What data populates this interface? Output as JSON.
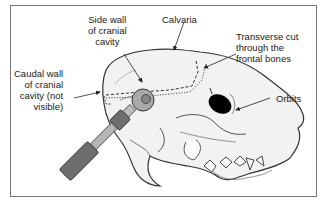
{
  "figure": {
    "labels": {
      "side_wall": "Side wall\nof cranial\ncavity",
      "calvaria": "Calvaria",
      "transverse_cut": "Transverse cut\nthrough the\nfrontal bones",
      "caudal_wall": "Caudal wall\nof cranial\ncavity (not\nvisible)",
      "orbits": "Orbits"
    },
    "colors": {
      "frame": "#777777",
      "skull_fill": "#f2f2f2",
      "outline": "#333333",
      "orbit": "#000000",
      "saw_body": "#6e6e6e",
      "saw_shaft": "#b5b5b5",
      "blade": "#a9a9a9",
      "blade_hub": "#888888"
    }
  }
}
